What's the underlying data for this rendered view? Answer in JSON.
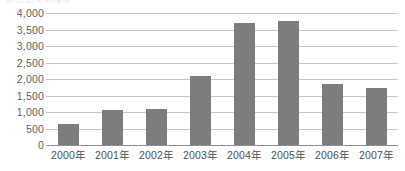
{
  "document": {
    "top_cropped_text": "調査結果の推移"
  },
  "chart_data": {
    "type": "bar",
    "title": "",
    "xlabel": "",
    "ylabel": "",
    "categories": [
      "2000年",
      "2001年",
      "2002年",
      "2003年",
      "2004年",
      "2005年",
      "2006年",
      "2007年"
    ],
    "values": [
      630,
      1050,
      1100,
      2100,
      3700,
      3750,
      1850,
      1730
    ],
    "ylim": [
      0,
      4000
    ],
    "ytick_step": 500,
    "ytick_labels": [
      "4,000",
      "3,500",
      "3,000",
      "2,500",
      "2,000",
      "1,500",
      "1,000",
      "500",
      "0"
    ],
    "ytick_values": [
      4000,
      3500,
      3000,
      2500,
      2000,
      1500,
      1000,
      500,
      0
    ],
    "grid": true,
    "legend": false,
    "legend_position": "none",
    "series": [
      {
        "name": "件数",
        "values": [
          630,
          1050,
          1100,
          2100,
          3700,
          3750,
          1850,
          1730
        ]
      }
    ],
    "colors": {
      "bar_fill": "#7d7d7d",
      "gridline": "#c4c4c4",
      "axis_line": "#8f8f8f",
      "ytick_text": "#5e5e5e",
      "xtick_text": "#4f4f4f",
      "background": "#ffffff"
    }
  }
}
